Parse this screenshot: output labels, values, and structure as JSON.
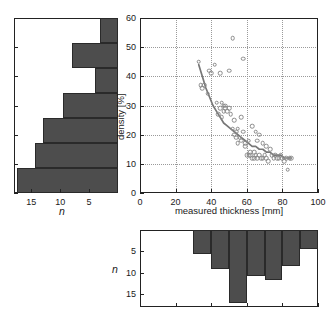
{
  "chart_data": [
    {
      "id": "scatter",
      "type": "scatter",
      "title": "",
      "xlabel": "measured thickness [mm]",
      "ylabel": "density [%]",
      "xlim": [
        0,
        100
      ],
      "ylim": [
        0,
        60
      ],
      "xticks": [
        0,
        20,
        40,
        60,
        80,
        100
      ],
      "yticks": [
        0,
        10,
        20,
        30,
        40,
        50,
        60
      ],
      "grid": true,
      "legend": "none",
      "points": [
        [
          33,
          45
        ],
        [
          34,
          37
        ],
        [
          35,
          36
        ],
        [
          36,
          37
        ],
        [
          38,
          34
        ],
        [
          39,
          42
        ],
        [
          40,
          41
        ],
        [
          42,
          44
        ],
        [
          43,
          31
        ],
        [
          44,
          27
        ],
        [
          45,
          41
        ],
        [
          45,
          29
        ],
        [
          46,
          26
        ],
        [
          46,
          31
        ],
        [
          47,
          30
        ],
        [
          47,
          28
        ],
        [
          48,
          30
        ],
        [
          48,
          29
        ],
        [
          49,
          28
        ],
        [
          50,
          29
        ],
        [
          50,
          42
        ],
        [
          51,
          27
        ],
        [
          52,
          22
        ],
        [
          52,
          53
        ],
        [
          53,
          20
        ],
        [
          53,
          25
        ],
        [
          54,
          21
        ],
        [
          54,
          19
        ],
        [
          55,
          17
        ],
        [
          55,
          22
        ],
        [
          56,
          19
        ],
        [
          57,
          18
        ],
        [
          57,
          26
        ],
        [
          58,
          21
        ],
        [
          58,
          46
        ],
        [
          59,
          16
        ],
        [
          59,
          17
        ],
        [
          60,
          13
        ],
        [
          61,
          13
        ],
        [
          61,
          18
        ],
        [
          62,
          14
        ],
        [
          62,
          13
        ],
        [
          63,
          12
        ],
        [
          63,
          23
        ],
        [
          64,
          12
        ],
        [
          64,
          14
        ],
        [
          65,
          21
        ],
        [
          65,
          13
        ],
        [
          66,
          12
        ],
        [
          66,
          18
        ],
        [
          67,
          13
        ],
        [
          67,
          20
        ],
        [
          68,
          12
        ],
        [
          69,
          12
        ],
        [
          69,
          17
        ],
        [
          70,
          13
        ],
        [
          71,
          16
        ],
        [
          71,
          12
        ],
        [
          72,
          11
        ],
        [
          73,
          15
        ],
        [
          74,
          13
        ],
        [
          75,
          12
        ],
        [
          76,
          13
        ],
        [
          77,
          12
        ],
        [
          78,
          12
        ],
        [
          79,
          13
        ],
        [
          80,
          12
        ],
        [
          81,
          11
        ],
        [
          82,
          12
        ],
        [
          83,
          8
        ],
        [
          84,
          12
        ],
        [
          85,
          12
        ]
      ],
      "fit_curve": {
        "style": "solid",
        "color": "#777777",
        "points": [
          [
            33,
            44
          ],
          [
            35,
            40
          ],
          [
            37,
            36
          ],
          [
            39,
            33
          ],
          [
            41,
            30
          ],
          [
            43,
            28
          ],
          [
            45,
            26
          ],
          [
            47,
            24
          ],
          [
            49,
            23
          ],
          [
            51,
            22
          ],
          [
            53,
            21
          ],
          [
            55,
            20
          ],
          [
            57,
            19
          ],
          [
            59,
            18
          ],
          [
            61,
            17
          ],
          [
            63,
            16
          ],
          [
            65,
            16
          ],
          [
            67,
            15
          ],
          [
            69,
            15
          ],
          [
            71,
            14
          ],
          [
            73,
            14
          ],
          [
            75,
            13
          ],
          [
            77,
            13
          ],
          [
            79,
            13
          ],
          [
            81,
            12
          ],
          [
            83,
            12
          ],
          [
            85,
            12
          ]
        ]
      }
    },
    {
      "id": "left-histogram",
      "type": "bar",
      "orientation": "horizontal",
      "title": "",
      "xlabel": "n",
      "ylabel": "density [%]",
      "xlim": [
        18,
        0
      ],
      "ylim": [
        0,
        60
      ],
      "xticks": [
        15,
        10,
        5
      ],
      "xtick_labels": [
        "15",
        "10",
        "5"
      ],
      "bin_edges": [
        0,
        8.6,
        17.1,
        25.7,
        34.3,
        42.9,
        51.4,
        60
      ],
      "values_top_to_bottom": [
        3.2,
        8.0,
        4.0,
        9.5,
        13.0,
        14.3,
        17.5
      ],
      "note": "Bars extend leftward from the right edge of the panel; topmost bin is highest density."
    },
    {
      "id": "bottom-histogram",
      "type": "bar",
      "orientation": "vertical-down",
      "title": "",
      "xlabel": "measured thickness [mm]",
      "ylabel": "n",
      "xlim": [
        0,
        100
      ],
      "ylim": [
        18,
        0
      ],
      "yticks": [
        5,
        10,
        15
      ],
      "ytick_labels": [
        "5",
        "10",
        "15"
      ],
      "bin_edges": [
        30,
        40,
        50,
        60,
        70,
        80,
        90,
        100
      ],
      "values": [
        5.6,
        9.2,
        17.1,
        10.8,
        11.7,
        8.5,
        4.4
      ],
      "note": "Bars hang downward from the top edge of the panel."
    }
  ],
  "left_histogram": {
    "xlabel": "n",
    "xtick_labels": [
      "15",
      "10",
      "5"
    ]
  },
  "scatter": {
    "xlabel": "measured thickness [mm]",
    "ylabel": "density [%]",
    "xtick_labels": [
      "0",
      "20",
      "40",
      "60",
      "80",
      "100"
    ],
    "ytick_labels": [
      "0",
      "10",
      "20",
      "30",
      "40",
      "50",
      "60"
    ]
  },
  "bottom_histogram": {
    "ylabel": "n",
    "ytick_labels": [
      "5",
      "10",
      "15"
    ]
  },
  "colors": {
    "bar_fill": "#4d4d4d",
    "bar_edge": "#2a2a2a",
    "axis": "#222222",
    "grid": "#9a9a9a",
    "marker_edge": "#8a8a8a",
    "fit_curve": "#777777"
  }
}
